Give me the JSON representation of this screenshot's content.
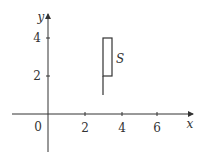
{
  "figure": {
    "type": "coordinate-plane-region",
    "axes": {
      "x_label": "x",
      "y_label": "y",
      "origin_label": "0",
      "x_ticks": [
        "2",
        "4",
        "6"
      ],
      "y_ticks": [
        "2",
        "4"
      ]
    },
    "region": {
      "label": "S",
      "rectangle": {
        "x_min": 3,
        "x_max": 3.5,
        "y_min": 2,
        "y_max": 4
      },
      "segment": {
        "x": 3,
        "y_from": 1,
        "y_to": 2
      }
    },
    "colors": {
      "stroke": "#333333",
      "background": "#ffffff"
    }
  }
}
